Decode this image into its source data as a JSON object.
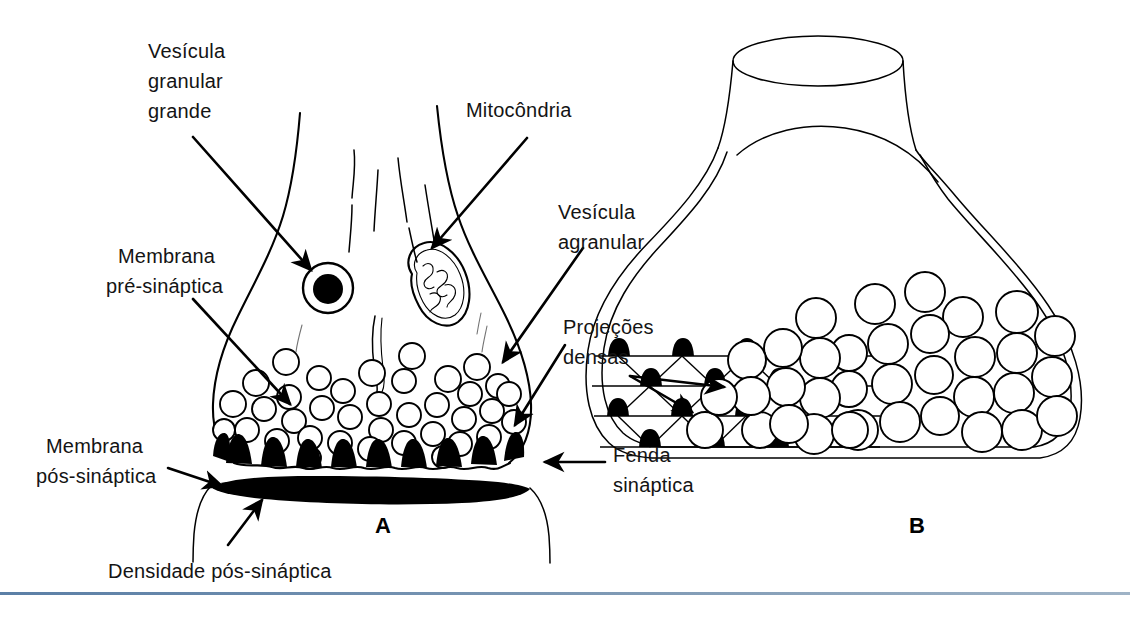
{
  "figure": {
    "language": "pt-BR",
    "background_color": "#ffffff",
    "ink_color": "#000000",
    "rule_color": "#5b7fa6"
  },
  "panels": [
    {
      "id": "A",
      "label": "A",
      "caption": "Corte longitudinal do terminal pré-sináptico"
    },
    {
      "id": "B",
      "label": "B",
      "caption": "Vista tridimensional da grade de projeções densas"
    }
  ],
  "labels": [
    {
      "id": "vesicula-granular-grande",
      "lines": [
        "Vesícula",
        "granular",
        "grande"
      ],
      "text": "Vesícula granular grande",
      "points_to": "large-granular-vesicle",
      "panel": "A"
    },
    {
      "id": "mitocondria",
      "lines": [
        "Mitocôndria"
      ],
      "text": "Mitocôndria",
      "points_to": "mitochondrion",
      "panel": "A"
    },
    {
      "id": "membrana-pre-sinaptica",
      "lines": [
        "Membrana",
        "pré-sináptica"
      ],
      "text": "Membrana pré-sináptica",
      "points_to": "presynaptic-membrane",
      "panel": "A"
    },
    {
      "id": "vesicula-agranular",
      "lines": [
        "Vesícula",
        "agranular"
      ],
      "text": "Vesícula agranular",
      "points_to": "agranular-vesicle",
      "panel": "A"
    },
    {
      "id": "projecoes-densas",
      "lines": [
        "Projeções",
        "densas"
      ],
      "text": "Projeções densas",
      "points_to": "dense-projections",
      "panel": "B",
      "arrow_count": 2
    },
    {
      "id": "membrana-pos-sinaptica",
      "lines": [
        "Membrana",
        "pós-sináptica"
      ],
      "text": "Membrana pós-sináptica",
      "points_to": "postsynaptic-membrane",
      "panel": "A"
    },
    {
      "id": "fenda-sinaptica",
      "lines": [
        "Fenda",
        "sináptica"
      ],
      "text": "Fenda sináptica",
      "points_to": "synaptic-cleft",
      "panel": "A"
    },
    {
      "id": "densidade-pos-sinaptica",
      "lines": [
        "Densidade pós-sináptica"
      ],
      "text": "Densidade pós-sináptica",
      "points_to": "postsynaptic-density",
      "panel": "A"
    }
  ],
  "structures": {
    "panel_a": {
      "bouton_outline": "presynaptic terminal bouton",
      "neurofilaments": 5,
      "large_granular_vesicle_count": 1,
      "mitochondrion_count": 1,
      "agranular_vesicle_count": 37,
      "dense_projection_count": 9,
      "postsynaptic_density": "thick black lens",
      "synaptic_cleft": "gap between pre- and postsynaptic membranes"
    },
    "panel_b": {
      "grid_rows": 4,
      "dense_projection_count": 14,
      "vesicle_count": 46,
      "outline": "double-walled bouton with axon neck"
    }
  }
}
